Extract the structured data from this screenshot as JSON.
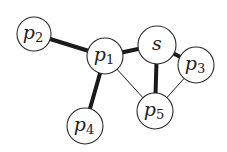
{
  "diagram": {
    "type": "graph",
    "colors": {
      "edge": "#1a1a1a",
      "node_stroke": "#2a2a2a",
      "node_fill": "#ffffff",
      "text": "#222222"
    },
    "nodes": [
      {
        "id": "p2",
        "base": "p",
        "sub": "2",
        "cx": 34,
        "cy": 34,
        "r": 17
      },
      {
        "id": "p1",
        "base": "p",
        "sub": "1",
        "cx": 105,
        "cy": 56,
        "r": 18
      },
      {
        "id": "s",
        "base": "s",
        "sub": "",
        "cx": 157,
        "cy": 45,
        "r": 19
      },
      {
        "id": "p3",
        "base": "p",
        "sub": "3",
        "cx": 196,
        "cy": 65,
        "r": 18
      },
      {
        "id": "p5",
        "base": "p",
        "sub": "5",
        "cx": 155,
        "cy": 111,
        "r": 18
      },
      {
        "id": "p4",
        "base": "p",
        "sub": "4",
        "cx": 85,
        "cy": 126,
        "r": 18
      }
    ],
    "edges": [
      {
        "from": "p2",
        "to": "p1",
        "weight": "thick"
      },
      {
        "from": "p1",
        "to": "s",
        "weight": "thick"
      },
      {
        "from": "p1",
        "to": "p4",
        "weight": "thick"
      },
      {
        "from": "s",
        "to": "p5",
        "weight": "thick"
      },
      {
        "from": "s",
        "to": "p3",
        "weight": "thick"
      },
      {
        "from": "p1",
        "to": "p5",
        "weight": "thin"
      },
      {
        "from": "p3",
        "to": "p5",
        "weight": "thin"
      }
    ]
  }
}
